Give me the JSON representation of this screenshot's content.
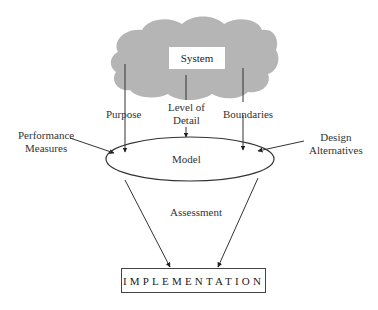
{
  "diagram": {
    "system": {
      "label": "System",
      "shape": "cloud",
      "fill": "#b4b4b4"
    },
    "inputs_from_system": [
      {
        "label": "Purpose"
      },
      {
        "label": "Level of Detail",
        "lines": [
          "Level of",
          "Detail"
        ]
      },
      {
        "label": "Boundaries"
      }
    ],
    "side_inputs": [
      {
        "label": "Performance Measures",
        "lines": [
          "Performance",
          "Measures"
        ]
      },
      {
        "label": "Design Alternatives",
        "lines": [
          "Design",
          "Alternatives"
        ]
      }
    ],
    "model": {
      "label": "Model",
      "shape": "ellipse"
    },
    "process": {
      "label": "Assessment"
    },
    "output": {
      "label": "IMPLEMENTATION",
      "shape": "rectangle"
    },
    "edges": [
      {
        "from": "System",
        "to": "Model",
        "label": "Purpose"
      },
      {
        "from": "System",
        "to": "Model",
        "label": "Level of Detail"
      },
      {
        "from": "System",
        "to": "Model",
        "label": "Boundaries"
      },
      {
        "from": "Performance Measures",
        "to": "Model"
      },
      {
        "from": "Design Alternatives",
        "to": "Model"
      },
      {
        "from": "Model",
        "to": "IMPLEMENTATION",
        "label": "Assessment"
      },
      {
        "from": "Model",
        "to": "IMPLEMENTATION",
        "label": "Assessment"
      }
    ]
  }
}
